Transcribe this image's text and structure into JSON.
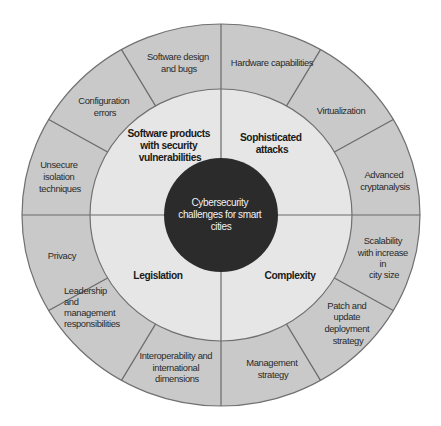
{
  "diagram": {
    "title": "Cybersecurity challenges for smart cities",
    "center": {
      "lines": [
        "Cybersecurity",
        "challenges for smart",
        "cities"
      ],
      "color": "#2b2b2b"
    },
    "categories": [
      {
        "label_lines": [
          "Software products",
          "with security",
          "vulnerabilities"
        ],
        "items": [
          {
            "lines": [
              "Unsecure",
              "isolation",
              "techniques"
            ]
          },
          {
            "lines": [
              "Configuration",
              "errors"
            ]
          },
          {
            "lines": [
              "Software design",
              "and bugs"
            ]
          }
        ]
      },
      {
        "label_lines": [
          "Sophisticated",
          "attacks"
        ],
        "items": [
          {
            "lines": [
              "Hardware capabilities"
            ]
          },
          {
            "lines": [
              "Virtualization"
            ]
          },
          {
            "lines": [
              "Advanced",
              "cryptanalysis"
            ]
          }
        ]
      },
      {
        "label_lines": [
          "Complexity"
        ],
        "items": [
          {
            "lines": [
              "Scalability",
              "with increase",
              "in",
              "city size"
            ]
          },
          {
            "lines": [
              "Patch and",
              "update",
              "deployment",
              "strategy"
            ]
          },
          {
            "lines": [
              "Management",
              "strategy"
            ]
          }
        ]
      },
      {
        "label_lines": [
          "Legislation"
        ],
        "items": [
          {
            "lines": [
              "Interoperability and",
              "international",
              "dimensions"
            ]
          },
          {
            "lines": [
              "Leadership",
              "and",
              "management",
              "responsibilities"
            ]
          },
          {
            "lines": [
              "Privacy"
            ]
          }
        ]
      }
    ],
    "colors": {
      "outer_ring": "#c9c9c9",
      "middle_ring": "#e6e6e6",
      "core": "#2b2b2b",
      "stroke": "#6a6a6a"
    }
  }
}
